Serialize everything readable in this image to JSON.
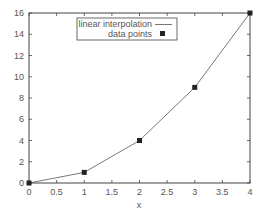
{
  "chart_data": {
    "type": "line",
    "title": "",
    "xlabel": "x",
    "ylabel": "",
    "xlim": [
      0,
      4
    ],
    "ylim": [
      0,
      16
    ],
    "x_ticks": [
      "0",
      "0.5",
      "1",
      "1.5",
      "2",
      "2.5",
      "3",
      "3.5",
      "4"
    ],
    "y_ticks": [
      "0",
      "2",
      "4",
      "6",
      "8",
      "10",
      "12",
      "14",
      "16"
    ],
    "grid": false,
    "legend_position": "upper center",
    "series": [
      {
        "name": "linear interpolation",
        "style": "line",
        "x": [
          0,
          1,
          2,
          3,
          4
        ],
        "values": [
          0,
          1,
          4,
          9,
          16
        ],
        "color": "#555555"
      },
      {
        "name": "data points",
        "style": "markers",
        "marker": "square",
        "x": [
          0,
          1,
          2,
          3,
          4
        ],
        "values": [
          0,
          1,
          4,
          9,
          16
        ],
        "color": "#222222"
      }
    ]
  },
  "legend": {
    "items": [
      {
        "label": "linear interpolation"
      },
      {
        "label": "data points"
      }
    ]
  }
}
